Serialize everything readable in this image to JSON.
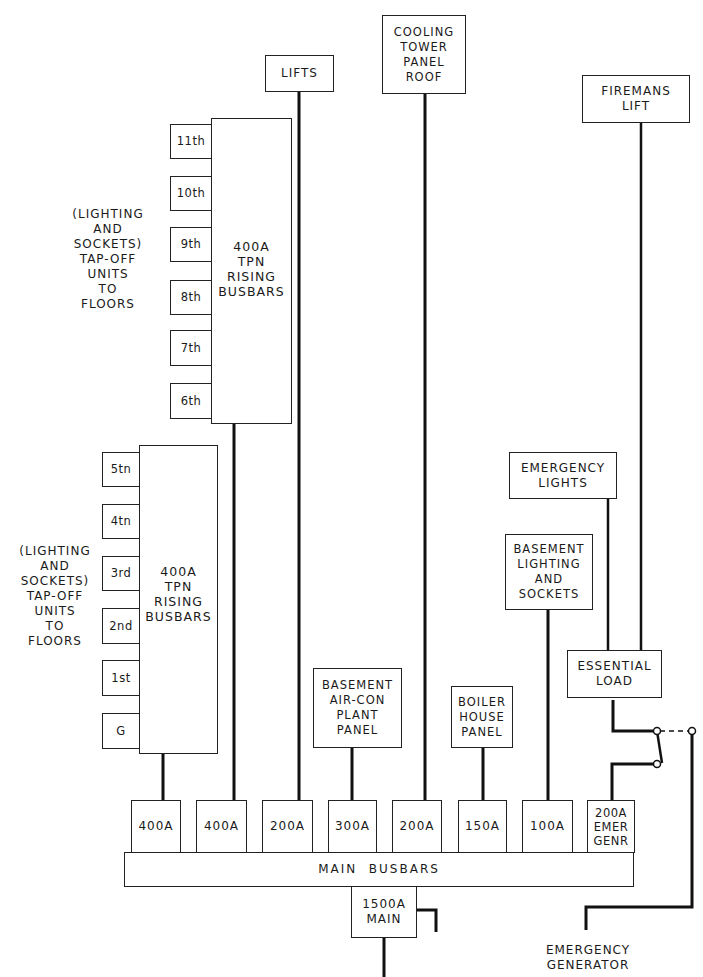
{
  "diagram": {
    "upper_riser": {
      "label": "400A\nTPN\nRISING\nBUSBARS",
      "floors": [
        "11th",
        "10th",
        "9th",
        "8th",
        "7th",
        "6th"
      ],
      "note": "(LIGHTING\nAND\nSOCKETS)\nTAP-OFF\nUNITS\nTO\nFLOORS"
    },
    "lower_riser": {
      "label": "400A\nTPN\nRISING\nBUSBARS",
      "floors": [
        "5tn",
        "4tn",
        "3rd",
        "2nd",
        "1st",
        "G"
      ],
      "note": "(LIGHTING\nAND\nSOCKETS)\nTAP-OFF\nUNITS\nTO\nFLOORS"
    },
    "loads": {
      "lifts": "LIFTS",
      "cooling_tower": "COOLING\nTOWER\nPANEL\nROOF",
      "firemans_lift": "FIREMANS\nLIFT",
      "emergency_lights": "EMERGENCY\nLIGHTS",
      "basement_lighting": "BASEMENT\nLIGHTING\nAND\nSOCKETS",
      "essential_load": "ESSENTIAL\nLOAD",
      "basement_aircon": "BASEMENT\nAIR-CON\nPLANT\nPANEL",
      "boiler_house": "BOILER\nHOUSE\nPANEL"
    },
    "breakers": [
      "400A",
      "400A",
      "200A",
      "300A",
      "200A",
      "150A",
      "100A",
      "200A\nEMER\nGENR"
    ],
    "main_busbars": "MAIN  BUSBARS",
    "main_switch": "1500A\nMAIN",
    "emergency_generator": "EMERGENCY\nGENERATOR"
  }
}
